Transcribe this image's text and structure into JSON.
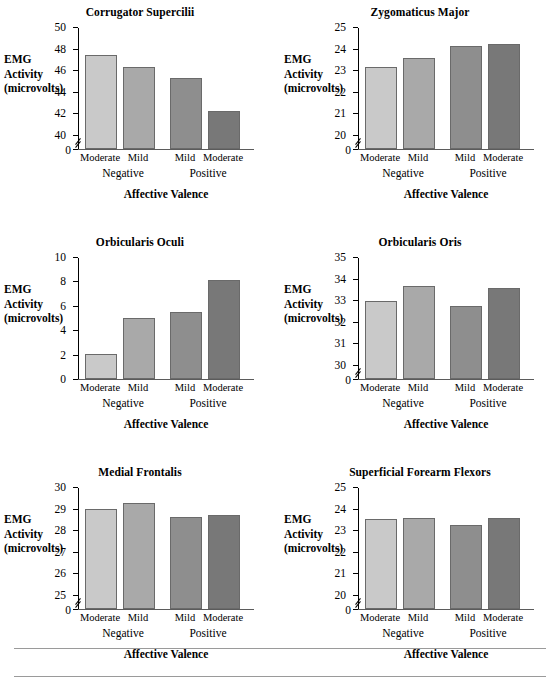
{
  "figure": {
    "y_axis_label_lines": [
      "EMG",
      "Activity",
      "(microvolts)"
    ],
    "x_axis_label": "Affective Valence",
    "zero_label": "0",
    "categories_top": [
      "Moderate",
      "Mild",
      "Mild",
      "Moderate"
    ],
    "groups": [
      {
        "label": "Negative"
      },
      {
        "label": "Positive"
      }
    ],
    "bar_colors": [
      "#c9c9c9",
      "#a9a9a9",
      "#8e8e8e",
      "#787878"
    ]
  },
  "chart_data": [
    {
      "type": "bar",
      "title": "Corrugator Supercilii",
      "xlabel": "Affective Valence",
      "ylabel": "EMG Activity (microvolts)",
      "categories": [
        "Moderate Negative",
        "Mild Negative",
        "Mild Positive",
        "Moderate Positive"
      ],
      "values": [
        47.5,
        46.35,
        45.35,
        42.35
      ],
      "ylim": [
        40,
        50
      ],
      "yticks": [
        40,
        42,
        44,
        46,
        48,
        50
      ],
      "axis_break": true,
      "grid": false
    },
    {
      "type": "bar",
      "title": "Zygomaticus Major",
      "xlabel": "Affective Valence",
      "ylabel": "EMG Activity (microvolts)",
      "categories": [
        "Moderate Negative",
        "Mild Negative",
        "Mild Positive",
        "Moderate Positive"
      ],
      "values": [
        23.2,
        23.6,
        24.15,
        24.25
      ],
      "ylim": [
        20,
        25
      ],
      "yticks": [
        20,
        21,
        22,
        23,
        24,
        25
      ],
      "axis_break": true,
      "grid": false
    },
    {
      "type": "bar",
      "title": "Orbicularis Oculi",
      "xlabel": "Affective Valence",
      "ylabel": "EMG Activity (microvolts)",
      "categories": [
        "Moderate Negative",
        "Mild Negative",
        "Mild Positive",
        "Moderate Positive"
      ],
      "values": [
        2.1,
        5.1,
        5.6,
        8.2
      ],
      "ylim": [
        0,
        10
      ],
      "yticks": [
        0,
        2,
        4,
        6,
        8,
        10
      ],
      "axis_break": false,
      "grid": false
    },
    {
      "type": "bar",
      "title": "Orbicularis Oris",
      "xlabel": "Affective Valence",
      "ylabel": "EMG Activity (microvolts)",
      "categories": [
        "Moderate Negative",
        "Mild Negative",
        "Mild Positive",
        "Moderate Positive"
      ],
      "values": [
        33.0,
        33.7,
        32.8,
        33.6
      ],
      "ylim": [
        30,
        35
      ],
      "yticks": [
        30,
        31,
        32,
        33,
        34,
        35
      ],
      "axis_break": true,
      "grid": false
    },
    {
      "type": "bar",
      "title": "Medial Frontalis",
      "xlabel": "Affective Valence",
      "ylabel": "EMG Activity (microvolts)",
      "categories": [
        "Moderate Negative",
        "Mild Negative",
        "Mild Positive",
        "Moderate Positive"
      ],
      "values": [
        29.05,
        29.3,
        28.65,
        28.75
      ],
      "ylim": [
        25,
        30
      ],
      "yticks": [
        25,
        26,
        27,
        28,
        29,
        30
      ],
      "axis_break": true,
      "grid": false
    },
    {
      "type": "bar",
      "title": "Superficial Forearm Flexors",
      "xlabel": "Affective Valence",
      "ylabel": "EMG Activity (microvolts)",
      "categories": [
        "Moderate Negative",
        "Mild Negative",
        "Mild Positive",
        "Moderate Positive"
      ],
      "values": [
        23.55,
        23.6,
        23.3,
        23.6
      ],
      "ylim": [
        20,
        25
      ],
      "yticks": [
        20,
        21,
        22,
        23,
        24,
        25
      ],
      "axis_break": true,
      "grid": false
    }
  ]
}
